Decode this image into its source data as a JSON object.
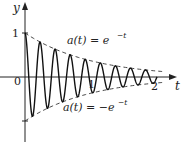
{
  "chart_data": {
    "type": "line",
    "title": "",
    "xlabel": "t",
    "ylabel": "y",
    "xlim": [
      0,
      2.25
    ],
    "ylim": [
      -1.4,
      1.1
    ],
    "x_ticks": [
      {
        "value": 0,
        "label": "0"
      },
      {
        "value": 1,
        "label": "1"
      },
      {
        "value": 2,
        "label": "2"
      }
    ],
    "y_ticks": [
      {
        "value": 1,
        "label": "1"
      },
      {
        "value": -1,
        "label": ""
      }
    ],
    "grid": false,
    "series": [
      {
        "name": "damped oscillation",
        "formula": "e^{-t} cos(27.5 t)",
        "style": "solid",
        "t_range": [
          0,
          2.0
        ],
        "angular_frequency": 27.5
      },
      {
        "name": "upper envelope",
        "formula": "a(t) = e^{-t}",
        "style": "dashed",
        "t_range": [
          0,
          2.1
        ]
      },
      {
        "name": "lower envelope",
        "formula": "a(t) = -e^{-t}",
        "style": "dashed",
        "t_range": [
          0,
          2.1
        ]
      }
    ],
    "annotations": [
      {
        "text": "a(t) = e^{-t}",
        "near": "upper envelope"
      },
      {
        "text": "a(t) = -e^{-t}",
        "near": "lower envelope"
      }
    ]
  },
  "labels": {
    "y_axis": "y",
    "t_axis": "t",
    "origin": "0",
    "y_one": "1",
    "t_one": "1",
    "t_two": "2",
    "upper_prefix": "a(t) = e",
    "upper_exp": "−t",
    "lower_prefix": "a(t) = −e",
    "lower_exp": "−t"
  },
  "geometry": {
    "origin_x": 25,
    "origin_y": 77,
    "px_per_t": 66,
    "px_per_y": 44
  }
}
